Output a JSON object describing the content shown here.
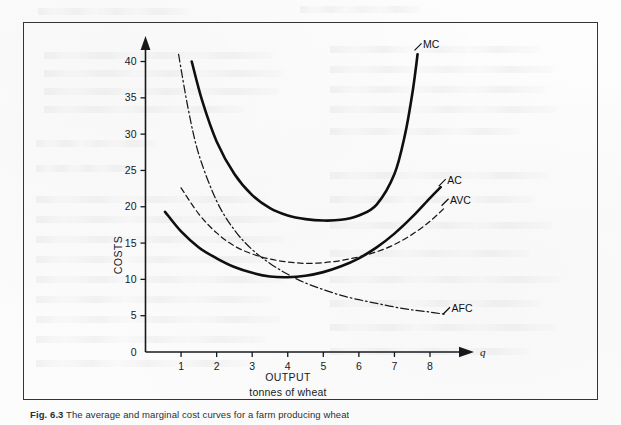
{
  "figure": {
    "caption_prefix": "Fig. 6.3",
    "caption_text": "The average and marginal cost curves for a farm producing wheat",
    "border_color": "#30353a"
  },
  "chart_data": {
    "type": "line",
    "title": "",
    "xlabel": "OUTPUT",
    "xlabel_sub": "tonnes of wheat",
    "ylabel": "COSTS",
    "axis_symbol_x": "q",
    "xlim": [
      0,
      8.9
    ],
    "ylim": [
      0,
      42
    ],
    "xticks": [
      1,
      2,
      3,
      4,
      5,
      6,
      7,
      8
    ],
    "yticks": [
      0,
      5,
      10,
      15,
      20,
      25,
      30,
      35,
      40
    ],
    "grid": false,
    "legend": "inline-labels",
    "series": [
      {
        "name": "MC",
        "label": "MC",
        "style": "solid-thick",
        "color": "#0d0f11",
        "x": [
          1.3,
          1.6,
          2.0,
          2.5,
          3.0,
          3.5,
          4.0,
          4.5,
          5.0,
          5.5,
          6.0,
          6.5,
          7.0,
          7.3,
          7.5,
          7.6,
          7.65
        ],
        "y": [
          40.0,
          34.5,
          29.0,
          24.5,
          21.6,
          19.8,
          18.8,
          18.3,
          18.1,
          18.2,
          18.8,
          20.3,
          24.5,
          30.0,
          35.5,
          39.0,
          41.0
        ]
      },
      {
        "name": "AC",
        "label": "AC",
        "style": "solid-thick",
        "color": "#0d0f11",
        "x": [
          0.55,
          1.0,
          1.5,
          2.0,
          2.5,
          3.0,
          3.5,
          4.0,
          4.5,
          5.0,
          5.5,
          6.0,
          6.5,
          7.0,
          7.5,
          8.0,
          8.3
        ],
        "y": [
          19.3,
          16.6,
          14.4,
          12.9,
          11.7,
          10.9,
          10.4,
          10.3,
          10.5,
          11.0,
          11.8,
          12.9,
          14.4,
          16.3,
          18.6,
          21.2,
          22.7
        ]
      },
      {
        "name": "AVC",
        "label": "AVC",
        "style": "dashed",
        "color": "#16191c",
        "x": [
          1.0,
          1.5,
          2.0,
          2.5,
          3.0,
          3.5,
          4.0,
          4.5,
          5.0,
          5.5,
          6.0,
          6.5,
          7.0,
          7.5,
          8.0,
          8.4
        ],
        "y": [
          22.6,
          19.0,
          16.4,
          14.6,
          13.5,
          12.8,
          12.4,
          12.2,
          12.3,
          12.6,
          13.1,
          13.8,
          14.8,
          16.2,
          18.0,
          19.8
        ]
      },
      {
        "name": "AFC",
        "label": "AFC",
        "style": "dash-dot",
        "color": "#16191c",
        "x": [
          0.93,
          1.2,
          1.5,
          2.0,
          2.5,
          3.0,
          3.5,
          4.0,
          4.5,
          5.0,
          5.5,
          6.0,
          6.5,
          7.0,
          7.5,
          8.0,
          8.4
        ],
        "y": [
          41.0,
          33.5,
          27.2,
          20.8,
          16.8,
          14.1,
          12.2,
          10.7,
          9.5,
          8.6,
          7.8,
          7.2,
          6.7,
          6.2,
          5.8,
          5.5,
          5.2
        ]
      }
    ],
    "annotations": [
      {
        "text": "MC",
        "x": 7.72,
        "y": 42.3
      },
      {
        "text": "AC",
        "x": 8.4,
        "y": 23.6
      },
      {
        "text": "AVC",
        "x": 8.48,
        "y": 20.9
      },
      {
        "text": "AFC",
        "x": 8.52,
        "y": 5.95
      }
    ]
  }
}
